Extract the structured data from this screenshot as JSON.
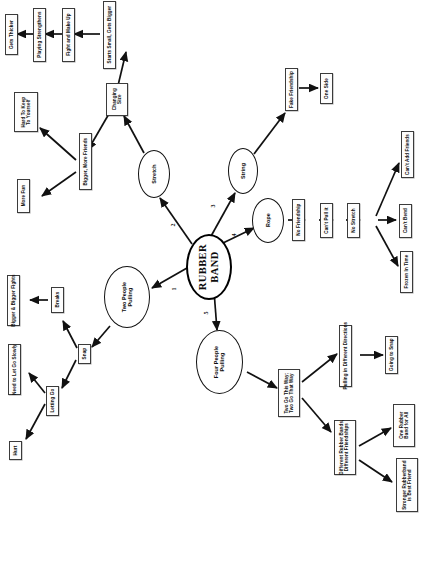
{
  "diagram": {
    "title": "RUBBER BAND",
    "orientation": "rotated-90-ccw",
    "type": "concept-map",
    "central_node": {
      "label": "RUBBER\nBAND"
    },
    "edge_labels": [
      {
        "id": "e1",
        "label": "1"
      },
      {
        "id": "e2",
        "label": "2"
      },
      {
        "id": "e3",
        "label": "3"
      },
      {
        "id": "e4",
        "label": "4"
      },
      {
        "id": "e5",
        "label": "5"
      }
    ],
    "ellipse_nodes": [
      {
        "id": "stretch",
        "label": "Stretch"
      },
      {
        "id": "string",
        "label": "String"
      },
      {
        "id": "rope",
        "label": "Rope"
      },
      {
        "id": "two-people-pulling",
        "label": "Two People\nPulling"
      },
      {
        "id": "four-people-pulling",
        "label": "Four People\nPulling"
      }
    ],
    "box_nodes": [
      {
        "id": "gets-thicker",
        "label": "Gets Thicker"
      },
      {
        "id": "playing-strengthens",
        "label": "Playing Strengthens"
      },
      {
        "id": "fight-and-make-up",
        "label": "Fight and Make Up"
      },
      {
        "id": "starts-small-gets-bigger",
        "label": "Starts Small, Gets Bigger"
      },
      {
        "id": "changing-size",
        "label": "Changing\nSize"
      },
      {
        "id": "hard-to-keep-to-yourself",
        "label": "Hard To Keep\nTo Yourself"
      },
      {
        "id": "bigger-more-friends",
        "label": "Bigger, More Friends"
      },
      {
        "id": "more-fun",
        "label": "More Fun"
      },
      {
        "id": "fake-friendship",
        "label": "Fake Friendship"
      },
      {
        "id": "one-side",
        "label": "One Side"
      },
      {
        "id": "no-friendship",
        "label": "No Friendship"
      },
      {
        "id": "cant-pull-it",
        "label": "Can't Pull it"
      },
      {
        "id": "no-stretch",
        "label": "No Stretch"
      },
      {
        "id": "cant-add-friends",
        "label": "Can't Add Friends"
      },
      {
        "id": "cant-bend",
        "label": "Can't Bend"
      },
      {
        "id": "frozen-in-time",
        "label": "Frozen In Time"
      },
      {
        "id": "snap",
        "label": "Snap"
      },
      {
        "id": "breaks",
        "label": "Breaks"
      },
      {
        "id": "bigger-and-bigger-fights",
        "label": "Bigger & Bigger Fights"
      },
      {
        "id": "letting-go",
        "label": "Letting Go"
      },
      {
        "id": "need-to-let-go-slowly",
        "label": "Need to Let Go Slowly"
      },
      {
        "id": "hurt",
        "label": "Hurt"
      },
      {
        "id": "two-go-this-way",
        "label": "Two Go This Way;\nTwo Go That Way"
      },
      {
        "id": "pulling-in-different-directions",
        "label": "Pulling in Different Directions"
      },
      {
        "id": "going-to-snap",
        "label": "Going to Snap"
      },
      {
        "id": "different-rubber-bands",
        "label": "Different Rubber Bands,\nDifferent Friendships"
      },
      {
        "id": "one-rubber-band-for-all",
        "label": "One Rubber\nBand for All"
      },
      {
        "id": "stronger-rubberband-is-best-friend",
        "label": "Stronger Rubberband\nis Best Friend"
      }
    ],
    "colors": {
      "ink": "#111111",
      "box_border": "#3b3b3b",
      "paper": "#ffffff",
      "margin_text": "#b9b9b9"
    }
  }
}
